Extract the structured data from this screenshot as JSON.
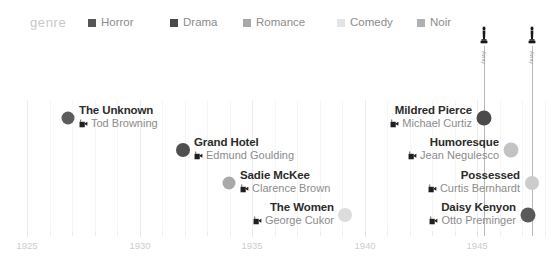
{
  "legend": {
    "title": "genre",
    "items": [
      {
        "label": "Horror",
        "color": "#555555",
        "x": 88,
        "icon": "legend-swatch-icon"
      },
      {
        "label": "Drama",
        "color": "#4a4a4a",
        "x": 170,
        "icon": "legend-swatch-icon"
      },
      {
        "label": "Romance",
        "color": "#a8a8a8",
        "x": 243,
        "icon": "legend-swatch-icon"
      },
      {
        "label": "Comedy",
        "color": "#e4e4e4",
        "x": 337,
        "icon": "legend-swatch-icon"
      },
      {
        "label": "Noir",
        "color": "#b0b0b0",
        "x": 417,
        "icon": "legend-swatch-icon"
      }
    ]
  },
  "axis": {
    "label": "",
    "major_ticks": [
      {
        "label": "1925",
        "x": 27
      },
      {
        "label": "1930",
        "x": 140
      },
      {
        "label": "1935",
        "x": 252
      },
      {
        "label": "1940",
        "x": 365
      },
      {
        "label": "1945",
        "x": 477
      }
    ],
    "minor_tick_x": [
      50,
      72,
      95,
      117,
      162,
      185,
      207,
      230,
      275,
      297,
      320,
      342,
      387,
      410,
      432,
      455,
      500,
      522,
      545
    ],
    "grid_major_x": [
      27,
      140,
      252,
      365,
      477
    ],
    "grid_minor_x": [
      50,
      72,
      95,
      117,
      162,
      185,
      207,
      230,
      275,
      297,
      320,
      342,
      387,
      410,
      432,
      455,
      500,
      522,
      545
    ]
  },
  "awards": [
    {
      "caption": "Away",
      "x": 484,
      "stem_top": 46,
      "stem_height": 190,
      "icon": "oscar-statuette-icon"
    },
    {
      "caption": "Away",
      "x": 532,
      "stem_top": 46,
      "stem_height": 190,
      "icon": "oscar-statuette-icon"
    }
  ],
  "films": [
    {
      "title": "The Unknown",
      "director": "Tod Browning",
      "genre": "Horror",
      "dot_color": "#5c5c5c",
      "dot_size": 13,
      "dot_x": 68,
      "row_y": 118,
      "label_align": "left",
      "label_offset": 11,
      "on_stem": false,
      "icon": "movie-camera-icon"
    },
    {
      "title": "Grand Hotel",
      "director": "Edmund Goulding",
      "genre": "Drama",
      "dot_color": "#4f4f4f",
      "dot_size": 14,
      "dot_x": 183,
      "row_y": 150,
      "label_align": "left",
      "label_offset": 11,
      "on_stem": false,
      "icon": "movie-camera-icon"
    },
    {
      "title": "Sadie McKee",
      "director": "Clarence Brown",
      "genre": "Romance",
      "dot_color": "#a9a9a9",
      "dot_size": 13,
      "dot_x": 229,
      "row_y": 183,
      "label_align": "left",
      "label_offset": 11,
      "on_stem": false,
      "icon": "movie-camera-icon"
    },
    {
      "title": "The Women",
      "director": "George Cukor",
      "genre": "Comedy",
      "dot_color": "#dcdcdc",
      "dot_size": 14,
      "dot_x": 345,
      "row_y": 215,
      "label_align": "right",
      "label_offset": 11,
      "on_stem": false,
      "icon": "movie-camera-icon"
    },
    {
      "title": "Mildred Pierce",
      "director": "Michael Curtiz",
      "genre": "Noir",
      "dot_color": "#4b4b4b",
      "dot_size": 15,
      "dot_x": 484,
      "row_y": 118,
      "label_align": "right",
      "label_offset": 12,
      "on_stem": true,
      "icon": "movie-camera-icon"
    },
    {
      "title": "Humoresque",
      "director": "Jean Negulesco",
      "genre": "Romance",
      "dot_color": "#c3c3c3",
      "dot_size": 15,
      "dot_x": 511,
      "row_y": 150,
      "label_align": "right",
      "label_offset": 12,
      "on_stem": false,
      "icon": "movie-camera-icon"
    },
    {
      "title": "Possessed",
      "director": "Curtis Bernhardt",
      "genre": "Noir",
      "dot_color": "#cccccc",
      "dot_size": 14,
      "dot_x": 532,
      "row_y": 183,
      "label_align": "right",
      "label_offset": 12,
      "on_stem": true,
      "icon": "movie-camera-icon"
    },
    {
      "title": "Daisy Kenyon",
      "director": "Otto Preminger",
      "genre": "Noir",
      "dot_color": "#5a5a5a",
      "dot_size": 15,
      "dot_x": 528,
      "row_y": 215,
      "label_align": "right",
      "label_offset": 12,
      "on_stem": false,
      "icon": "movie-camera-icon"
    }
  ],
  "chart_data": {
    "type": "scatter",
    "title": "",
    "xlabel": "",
    "ylabel": "",
    "xlim": [
      1924,
      1948
    ],
    "grid": true,
    "legend_position": "top",
    "legend_title": "genre",
    "legend_entries": [
      "Horror",
      "Drama",
      "Romance",
      "Comedy",
      "Noir"
    ],
    "x_tick_labels": [
      "1925",
      "1930",
      "1935",
      "1940",
      "1945"
    ],
    "annotations": [
      "Away",
      "Away"
    ],
    "points": [
      {
        "label": "The Unknown",
        "director": "Tod Browning",
        "genre": "Horror",
        "x": 1927,
        "row": 1,
        "award": false
      },
      {
        "label": "Grand Hotel",
        "director": "Edmund Goulding",
        "genre": "Drama",
        "x": 1932,
        "row": 2,
        "award": false
      },
      {
        "label": "Sadie McKee",
        "director": "Clarence Brown",
        "genre": "Romance",
        "x": 1934,
        "row": 3,
        "award": false
      },
      {
        "label": "The Women",
        "director": "George Cukor",
        "genre": "Comedy",
        "x": 1939,
        "row": 4,
        "award": false
      },
      {
        "label": "Mildred Pierce",
        "director": "Michael Curtiz",
        "genre": "Noir",
        "x": 1945,
        "row": 1,
        "award": true
      },
      {
        "label": "Humoresque",
        "director": "Jean Negulesco",
        "genre": "Romance",
        "x": 1946,
        "row": 2,
        "award": false
      },
      {
        "label": "Possessed",
        "director": "Curtis Bernhardt",
        "genre": "Noir",
        "x": 1947,
        "row": 3,
        "award": true
      },
      {
        "label": "Daisy Kenyon",
        "director": "Otto Preminger",
        "genre": "Noir",
        "x": 1947,
        "row": 4,
        "award": false
      }
    ]
  }
}
